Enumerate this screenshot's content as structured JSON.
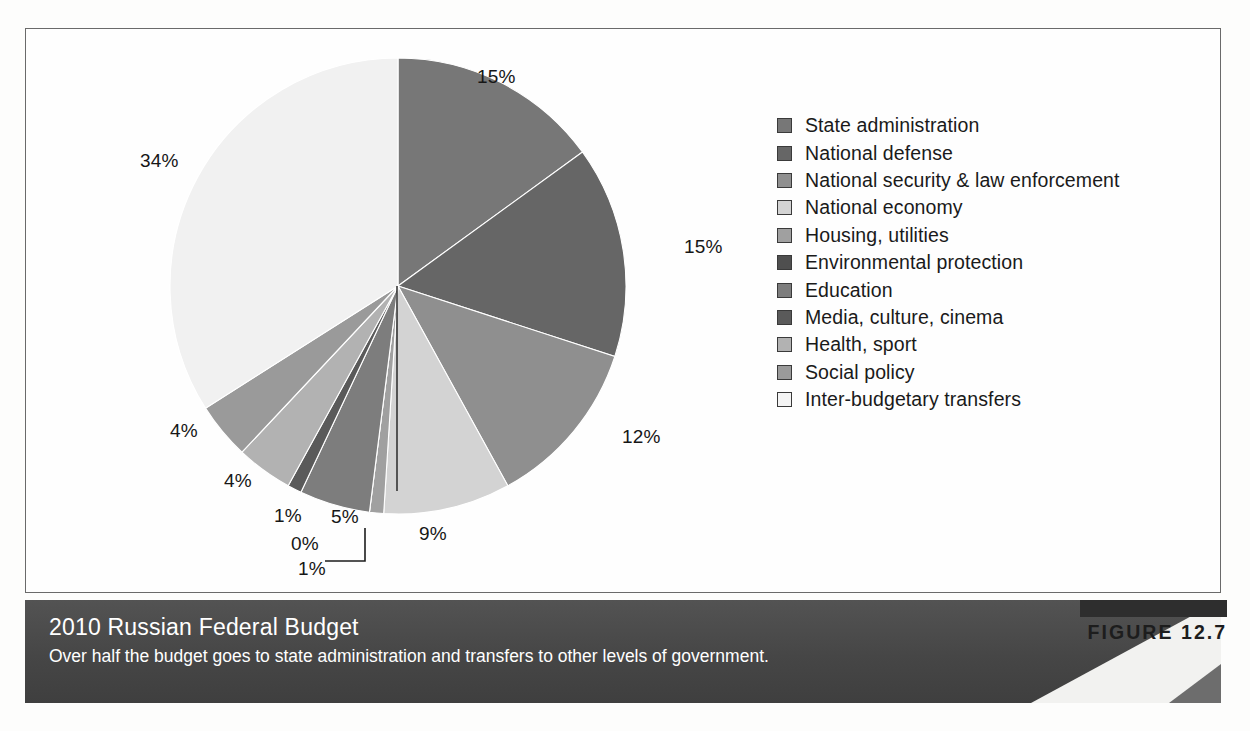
{
  "figure": {
    "tag": "FIGURE 12.7",
    "title": "2010 Russian Federal Budget",
    "caption": "Over half the budget goes to state administration and transfers to other levels of government."
  },
  "chart_data": {
    "type": "pie",
    "title": "2010 Russian Federal Budget",
    "subtitle": "Over half the budget goes to state administration and transfers to other levels of government.",
    "xlabel": "",
    "ylabel": "",
    "units": "percent",
    "legend_position": "right",
    "grid": false,
    "start_angle_deg": 0,
    "direction": "clockwise",
    "categories": [
      "State administration",
      "National defense",
      "National security & law enforcement",
      "National economy",
      "Housing, utilities",
      "Environmental protection",
      "Education",
      "Media, culture, cinema",
      "Health, sport",
      "Social policy",
      "Inter-budgetary transfers"
    ],
    "values": [
      15,
      15,
      12,
      9,
      1,
      0,
      5,
      1,
      4,
      4,
      34
    ],
    "labels": [
      "15%",
      "15%",
      "12%",
      "9%",
      "1%",
      "0%",
      "5%",
      "1%",
      "4%",
      "4%",
      "34%"
    ],
    "colors": [
      "#777777",
      "#666666",
      "#8f8f8f",
      "#d3d3d3",
      "#a0a0a0",
      "#4f4f4f",
      "#7d7d7d",
      "#5a5a5a",
      "#b2b2b2",
      "#9a9a9a",
      "#f1f1f1"
    ]
  },
  "legend": {
    "items": [
      {
        "label": "State administration",
        "color": "#777777"
      },
      {
        "label": "National defense",
        "color": "#666666"
      },
      {
        "label": "National security & law enforcement",
        "color": "#8f8f8f"
      },
      {
        "label": "National economy",
        "color": "#d3d3d3"
      },
      {
        "label": "Housing, utilities",
        "color": "#a0a0a0"
      },
      {
        "label": "Environmental protection",
        "color": "#4f4f4f"
      },
      {
        "label": "Education",
        "color": "#7d7d7d"
      },
      {
        "label": "Media, culture, cinema",
        "color": "#5a5a5a"
      },
      {
        "label": "Health, sport",
        "color": "#b2b2b2"
      },
      {
        "label": "Social policy",
        "color": "#9a9a9a"
      },
      {
        "label": "Inter-budgetary transfers",
        "color": "#f4f4f4"
      }
    ]
  },
  "pie_labels": [
    {
      "text": "15%",
      "x": 452,
      "y": 38
    },
    {
      "text": "15%",
      "x": 659,
      "y": 208
    },
    {
      "text": "12%",
      "x": 597,
      "y": 398
    },
    {
      "text": "9%",
      "x": 394,
      "y": 495
    },
    {
      "text": "0%",
      "x": 266,
      "y": 505
    },
    {
      "text": "1%",
      "x": 273,
      "y": 530
    },
    {
      "text": "5%",
      "x": 306,
      "y": 478
    },
    {
      "text": "1%",
      "x": 249,
      "y": 477
    },
    {
      "text": "4%",
      "x": 199,
      "y": 442
    },
    {
      "text": "4%",
      "x": 145,
      "y": 392
    },
    {
      "text": "34%",
      "x": 115,
      "y": 122
    }
  ]
}
